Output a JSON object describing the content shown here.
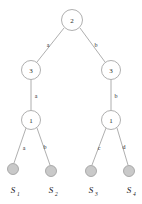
{
  "diagram": {
    "colors": {
      "stroke": "#9a9a9a",
      "node_fill": "#ffffff",
      "leaf_fill": "#c9c9c9",
      "text": "#2b2b2b",
      "background": "#ffffff"
    },
    "nodes": [
      {
        "id": "root",
        "value": "2",
        "cx": 72,
        "cy": 20,
        "r": 10.5
      },
      {
        "id": "left-l1",
        "value": "3",
        "cx": 31,
        "cy": 70,
        "r": 9.5
      },
      {
        "id": "right-l1",
        "value": "3",
        "cx": 111,
        "cy": 70,
        "r": 9.5
      },
      {
        "id": "left-l2",
        "value": "1",
        "cx": 31,
        "cy": 120,
        "r": 9.5
      },
      {
        "id": "right-l2",
        "value": "1",
        "cx": 111,
        "cy": 120,
        "r": 9.5
      }
    ],
    "leaves": [
      {
        "id": "leaf-1",
        "label": "S",
        "subscript": "1",
        "cx": 13,
        "cy": 169,
        "r": 5.5
      },
      {
        "id": "leaf-2",
        "label": "S",
        "subscript": "2",
        "cx": 51,
        "cy": 171,
        "r": 5.5
      },
      {
        "id": "leaf-3",
        "label": "S",
        "subscript": "3",
        "cx": 91,
        "cy": 171,
        "r": 5.5
      },
      {
        "id": "leaf-4",
        "label": "S",
        "subscript": "4",
        "cx": 129,
        "cy": 171,
        "r": 5.5
      }
    ],
    "edges": [
      {
        "id": "edge-root-left",
        "from": "root",
        "to": "left-l1",
        "label": "a",
        "lx": 48,
        "ly": 45
      },
      {
        "id": "edge-root-right",
        "from": "root",
        "to": "right-l1",
        "label": "b",
        "lx": 96,
        "ly": 45
      },
      {
        "id": "edge-left-down",
        "from": "left-l1",
        "to": "left-l2",
        "label": "a",
        "lx": 36,
        "ly": 96
      },
      {
        "id": "edge-right-down",
        "from": "right-l1",
        "to": "right-l2",
        "label": "b",
        "lx": 116,
        "ly": 96
      },
      {
        "id": "edge-leaf-1",
        "from": "left-l2",
        "to": "leaf-1",
        "label": "a",
        "lx": 24,
        "ly": 148
      },
      {
        "id": "edge-leaf-2",
        "from": "left-l2",
        "to": "leaf-2",
        "label": "b",
        "lx": 45,
        "ly": 147
      },
      {
        "id": "edge-leaf-3",
        "from": "right-l2",
        "to": "leaf-3",
        "label": "c",
        "lx": 99,
        "ly": 148
      },
      {
        "id": "edge-leaf-4",
        "from": "right-l2",
        "to": "leaf-4",
        "label": "d",
        "lx": 124,
        "ly": 147
      }
    ]
  }
}
